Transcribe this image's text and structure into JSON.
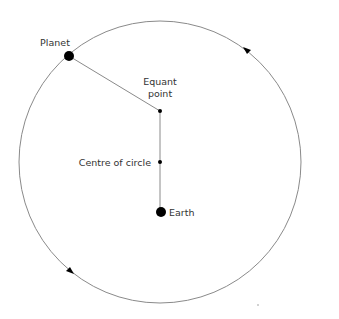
{
  "diagram": {
    "title": "",
    "type": "equant model",
    "labels": {
      "planet": "Planet",
      "equant_line1": "Equant",
      "equant_line2": "point",
      "centre": "Centre of circle",
      "earth": "Earth"
    },
    "circle": {
      "cx": 160,
      "cy": 162,
      "r": 141
    },
    "points": {
      "planet": {
        "x": 69,
        "y": 56,
        "r": 5
      },
      "equant": {
        "x": 160,
        "y": 111,
        "r": 2
      },
      "centre": {
        "x": 160,
        "y": 162,
        "r": 2
      },
      "earth": {
        "x": 161,
        "y": 212,
        "r": 5
      }
    },
    "arrows": [
      {
        "name": "direction-arrow-top-right",
        "x": 246,
        "y": 50,
        "direction": "counterclockwise"
      },
      {
        "name": "direction-arrow-bottom-left",
        "x": 71,
        "y": 271,
        "direction": "counterclockwise"
      }
    ],
    "colors": {
      "line": "#888888",
      "dot": "#000000",
      "text": "#333333"
    }
  }
}
